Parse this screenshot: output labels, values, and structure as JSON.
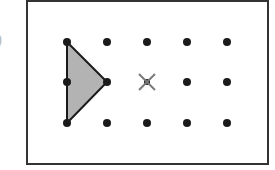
{
  "label": ")",
  "grid": {
    "columns": [
      67,
      107,
      147,
      187,
      227
    ],
    "rows": [
      42,
      82,
      123
    ],
    "dot_color": "#1a1a1a"
  },
  "triangle": {
    "points": [
      [
        67,
        42
      ],
      [
        107,
        82
      ],
      [
        67,
        123
      ]
    ],
    "fill": "#b3b3b3",
    "stroke": "#1a1a1a"
  },
  "marker": {
    "type": "x-mark",
    "position": [
      147,
      82
    ],
    "color": "#7a7a7a"
  },
  "frame": {
    "x": 27,
    "y": 1,
    "width": 241,
    "height": 163,
    "stroke": "#333333"
  }
}
